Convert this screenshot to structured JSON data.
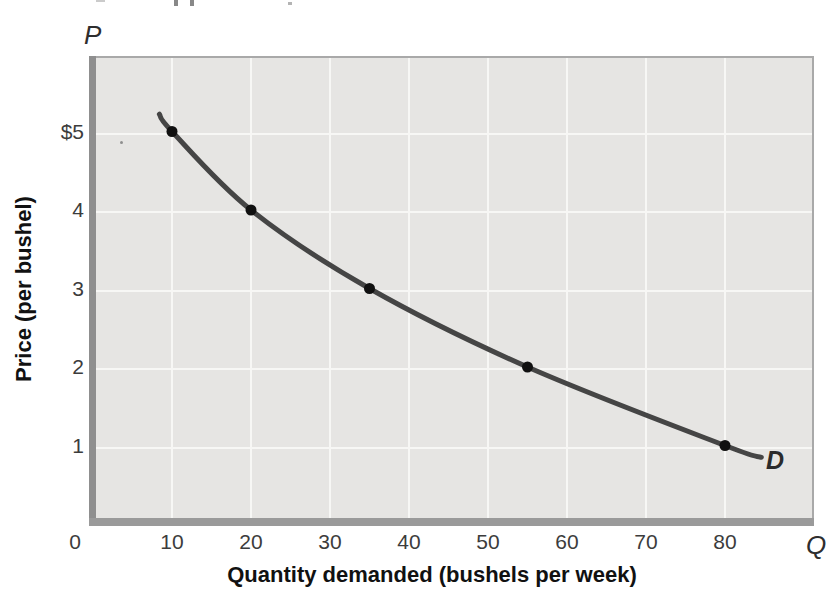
{
  "figure": {
    "p_symbol": "P",
    "q_symbol": "Q"
  },
  "chart_data": {
    "type": "line",
    "title": "",
    "xlabel": "Quantity demanded (bushels per week)",
    "ylabel": "Price (per bushel)",
    "xlim": [
      0,
      91
    ],
    "ylim": [
      0,
      5.9
    ],
    "grid": true,
    "legend_position": "none",
    "series": [
      {
        "name": "D",
        "label": "D",
        "points": [
          {
            "q": 10,
            "p": 5
          },
          {
            "q": 20,
            "p": 4
          },
          {
            "q": 35,
            "p": 3
          },
          {
            "q": 55,
            "p": 2
          },
          {
            "q": 80,
            "p": 1
          }
        ]
      }
    ],
    "curve_extent": {
      "q_start": 8.4,
      "p_start": 5.22,
      "q_end": 84.6,
      "p_end": 0.85
    },
    "x_ticks": [
      {
        "value": 0,
        "label": "0"
      },
      {
        "value": 10,
        "label": "10"
      },
      {
        "value": 20,
        "label": "20"
      },
      {
        "value": 30,
        "label": "30"
      },
      {
        "value": 40,
        "label": "40"
      },
      {
        "value": 50,
        "label": "50"
      },
      {
        "value": 60,
        "label": "60"
      },
      {
        "value": 70,
        "label": "70"
      },
      {
        "value": 80,
        "label": "80"
      }
    ],
    "y_ticks": [
      {
        "value": 5,
        "label": "$5"
      },
      {
        "value": 4,
        "label": "4"
      },
      {
        "value": 3,
        "label": "3"
      },
      {
        "value": 2,
        "label": "2"
      },
      {
        "value": 1,
        "label": "1"
      }
    ],
    "colors": {
      "plot_background": "#e6e5e3",
      "gridline": "#f7f7f5",
      "axis": "#8f8f8f",
      "curve": "#454545",
      "point": "#101010",
      "text": "#3c3c3c"
    }
  }
}
